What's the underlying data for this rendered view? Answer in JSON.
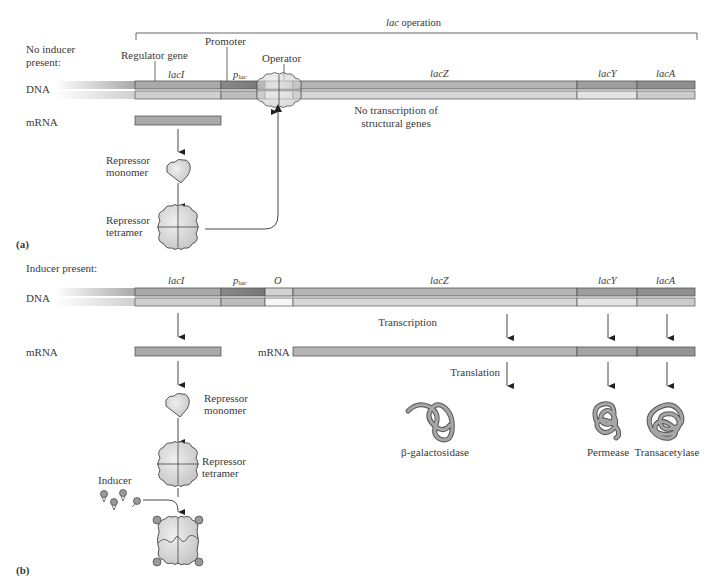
{
  "colors": {
    "background": "#ffffff",
    "text": "#3a3a3a",
    "laci_top": "#a9a9a9",
    "laci_bottom": "#cfcfcf",
    "promoter_top": "#8a8a8a",
    "promoter_bottom": "#bdbdbd",
    "operator_top": "#cfcfcf",
    "operator_bottom": "#f2f2f2",
    "lacz_top": "#b4b4b4",
    "lacz_bottom": "#d6d6d6",
    "lacy_top": "#9e9e9e",
    "lacy_bottom": "#e4e4e4",
    "laca_top": "#8f8f8f",
    "laca_bottom": "#cccccc",
    "repressor_fill": "#d8d8d8",
    "inducer_fill": "#9a9a9a"
  },
  "panel_a": {
    "label": "(a)",
    "condition": [
      "No inducer",
      "present:"
    ],
    "operon_label_italic": "lac",
    "operon_label_rest": " operation",
    "regulator_gene_label": "Regulator gene",
    "promoter_label": "Promoter",
    "operator_label": "Operator",
    "dna_label": "DNA",
    "mrna_label": "mRNA",
    "genes": {
      "laci": "lacI",
      "plac_p": "p",
      "plac_sub": "lac",
      "lacz": "lacZ",
      "lacy": "lacY",
      "laca": "lacA"
    },
    "no_transcription": [
      "No transcription of",
      "structural genes"
    ],
    "repressor_monomer": [
      "Repressor",
      "monomer"
    ],
    "repressor_tetramer": [
      "Repressor",
      "tetramer"
    ]
  },
  "panel_b": {
    "label": "(b)",
    "condition": "Inducer present:",
    "dna_label": "DNA",
    "mrna_label": "mRNA",
    "mrna_label_2": "mRNA",
    "genes": {
      "laci": "lacI",
      "plac_p": "p",
      "plac_sub": "lac",
      "operator": "O",
      "lacz": "lacZ",
      "lacy": "lacY",
      "laca": "lacA"
    },
    "transcription_label": "Transcription",
    "translation_label": "Translation",
    "repressor_monomer": [
      "Repressor",
      "monomer"
    ],
    "repressor_tetramer": [
      "Repressor",
      "tetramer"
    ],
    "inducer_label": "Inducer",
    "proteins": [
      "β-galactosidase",
      "Permease",
      "Transacetylase"
    ]
  }
}
